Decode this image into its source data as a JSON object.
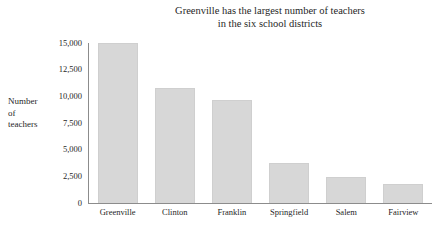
{
  "chart_data": {
    "type": "bar",
    "title": "Greenville has the largest number of teachers in the six school districts",
    "title_lines": [
      "Greenville has the largest number of teachers",
      "in the six school districts"
    ],
    "xlabel": "",
    "ylabel": "Number of teachers",
    "ylabel_lines": [
      "Number",
      "of",
      "teachers"
    ],
    "categories": [
      "Greenville",
      "Clinton",
      "Franklin",
      "Springfield",
      "Salem",
      "Fairview"
    ],
    "values": [
      15000,
      10800,
      9650,
      3750,
      2450,
      1800
    ],
    "ylim": [
      0,
      15000
    ],
    "yticks": [
      0,
      2500,
      5000,
      7500,
      10000,
      12500,
      15000
    ],
    "ytick_labels": [
      "0",
      "2,500",
      "5,000",
      "7,500",
      "10,000",
      "12,500",
      "15,000"
    ],
    "grid": false,
    "legend": false,
    "bar_color": "#d7d7d7",
    "bar_edge_color": "#cfcfcf",
    "axis_color": "#8c8c8c",
    "background_color": "#ffffff"
  }
}
